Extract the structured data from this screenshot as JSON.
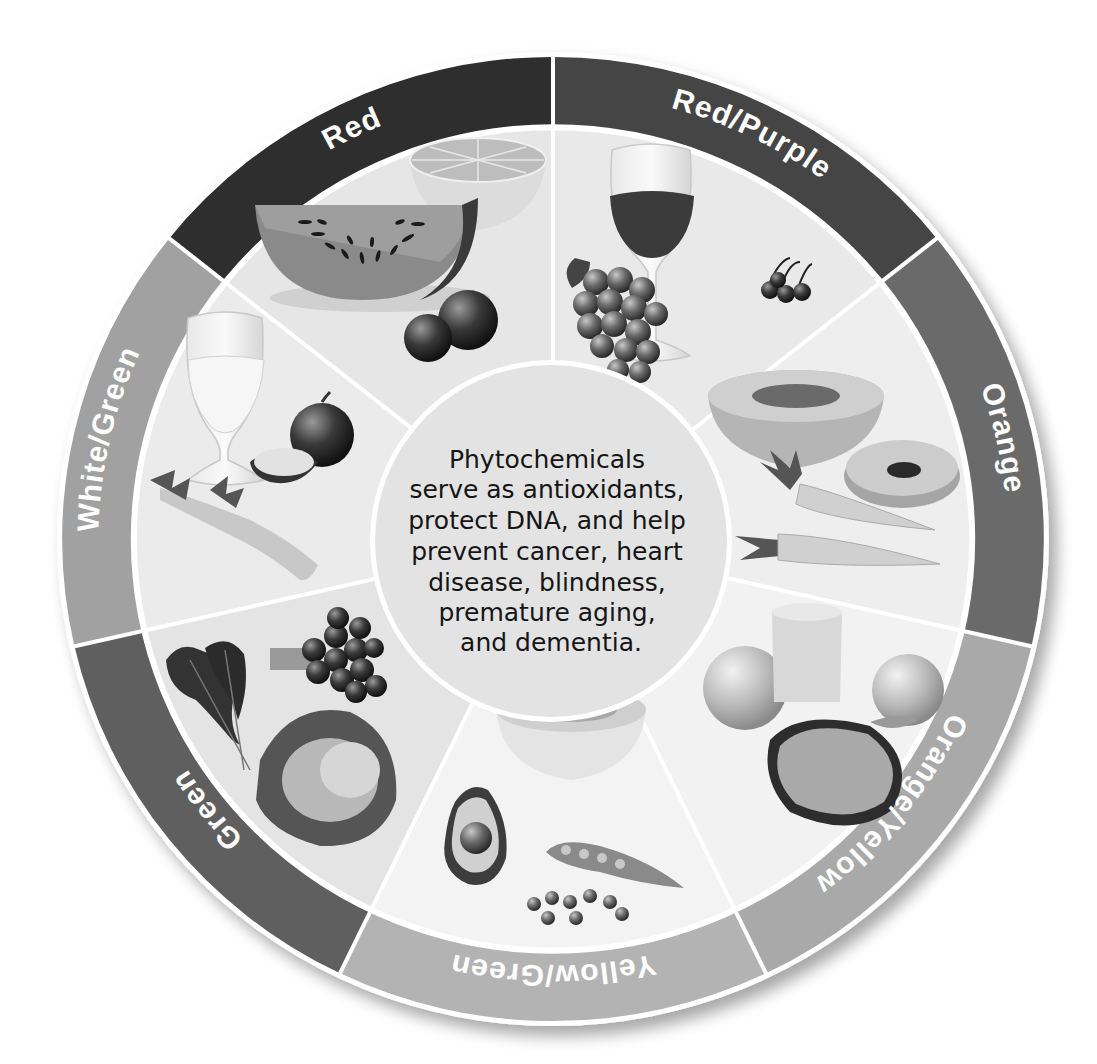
{
  "diagram": {
    "type": "wheel",
    "center": {
      "lines": [
        "Phytochemicals",
        "serve as antioxidants,",
        "protect DNA, and help",
        "prevent cancer, heart",
        "disease, blindness,",
        "premature aging,",
        "and dementia."
      ]
    },
    "segments": [
      {
        "label": "Red/Purple",
        "ring_color": "#444444",
        "wedge_color": "#e9e9e9",
        "foods": [
          "red wine glass",
          "grapes",
          "cherries"
        ]
      },
      {
        "label": "Orange",
        "ring_color": "#6b6b6b",
        "wedge_color": "#eeeeee",
        "foods": [
          "cantaloupe",
          "papaya half",
          "carrots"
        ]
      },
      {
        "label": "Orange/Yellow",
        "ring_color": "#a9a9a9",
        "wedge_color": "#f2f2f2",
        "foods": [
          "orange",
          "juice glass",
          "peach",
          "papaya"
        ]
      },
      {
        "label": "Yellow/Green",
        "ring_color": "#b3b3b3",
        "wedge_color": "#f3f3f3",
        "foods": [
          "melon bowl",
          "avocado",
          "pea pod",
          "peas"
        ]
      },
      {
        "label": "Green",
        "ring_color": "#5f5f5f",
        "wedge_color": "#e4e4e4",
        "foods": [
          "kale",
          "broccoli",
          "cabbage"
        ]
      },
      {
        "label": "White/Green",
        "ring_color": "#a1a1a1",
        "wedge_color": "#ebebeb",
        "foods": [
          "white wine glass",
          "onion",
          "celery"
        ]
      },
      {
        "label": "Red",
        "ring_color": "#2d2d2d",
        "wedge_color": "#e6e6e6",
        "foods": [
          "watermelon",
          "grapefruit",
          "tomatoes"
        ]
      }
    ]
  }
}
